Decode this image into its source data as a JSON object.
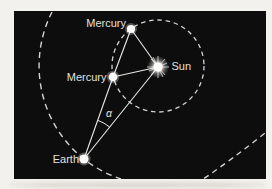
{
  "figure": {
    "type": "astronomy-orbit-diagram",
    "description_topic": "Mercury greatest elongation as seen from Earth",
    "colors": {
      "paper": "#f3f1ed",
      "panel": "#0d0d0d",
      "solid_line": "#e9e9e7",
      "dashed_line": "#d6d4cf",
      "text": "#e2e1dd",
      "body_dot": "#fbfbf9"
    },
    "labels": {
      "mercury_top": "Mercury",
      "mercury_inner": "Mercury",
      "sun": "Sun",
      "earth": "Earth",
      "angle": "α"
    },
    "elements": {
      "orbits": [
        "mercury-orbit-dashed-circle",
        "earth-orbit-dashed-arc",
        "earth-orbit-dashed-arc-lower-right"
      ],
      "sight_lines": [
        "earth-to-sun",
        "earth-to-mercury-inner",
        "mercury-inner-to-mercury-top",
        "sun-to-mercury-top",
        "sun-to-mercury-inner"
      ],
      "angle_marker": "elongation-angle-arc"
    }
  }
}
